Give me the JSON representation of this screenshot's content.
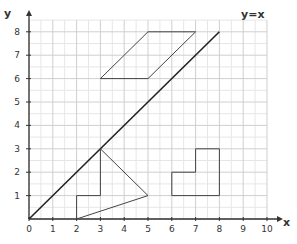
{
  "chart_data": {
    "type": "line",
    "title": "",
    "xlabel": "x",
    "ylabel": "y",
    "xlim": [
      0,
      10
    ],
    "ylim": [
      0,
      8.5
    ],
    "grid": {
      "major": true,
      "minor_step": 0.5
    },
    "x_ticks": [
      "0",
      "1",
      "2",
      "3",
      "4",
      "5",
      "6",
      "7",
      "8",
      "9",
      "10"
    ],
    "y_ticks": [
      "1",
      "2",
      "3",
      "4",
      "5",
      "6",
      "7",
      "8"
    ],
    "series": [
      {
        "name": "y=x",
        "kind": "line",
        "points": [
          [
            0,
            0
          ],
          [
            8,
            8
          ]
        ],
        "label": "y=x",
        "color": "#222222"
      },
      {
        "name": "parallelogram",
        "kind": "polygon",
        "points": [
          [
            3,
            6
          ],
          [
            5,
            6
          ],
          [
            7,
            8
          ],
          [
            5,
            8
          ]
        ],
        "color": "#444444"
      },
      {
        "name": "step-triangle",
        "kind": "polygon",
        "points": [
          [
            2,
            0
          ],
          [
            2,
            1
          ],
          [
            3,
            1
          ],
          [
            3,
            3
          ],
          [
            5,
            1
          ]
        ],
        "color": "#444444"
      },
      {
        "name": "l-shape",
        "kind": "polygon",
        "points": [
          [
            6,
            1
          ],
          [
            6,
            2
          ],
          [
            7,
            2
          ],
          [
            7,
            3
          ],
          [
            8,
            3
          ],
          [
            8,
            1
          ]
        ],
        "color": "#444444"
      }
    ]
  },
  "colors": {
    "axis": "#333333",
    "grid_major": "#cfcfcf",
    "grid_minor": "#e6e6e6",
    "shape": "#555555",
    "diagonal": "#222222"
  }
}
